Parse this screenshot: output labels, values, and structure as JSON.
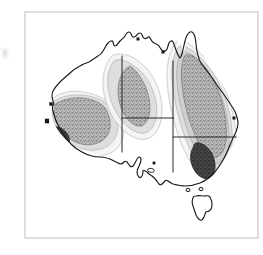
{
  "figure": {
    "width": 263,
    "height": 255,
    "background_color": "#ffffff",
    "frame": {
      "label": "map-frame",
      "x": 25,
      "y": 12,
      "width": 233,
      "height": 226,
      "stroke_color": "#c9c9c9",
      "stroke_width": 1.2,
      "fill_color": "#ffffff"
    },
    "artifacts": [
      {
        "name": "scan-smudge",
        "description": "faint gray scanning smudge at left margin",
        "x": 1,
        "y": 47,
        "width": 8,
        "height": 12,
        "color": "#969696"
      }
    ]
  },
  "map": {
    "region_name": "Australia",
    "coastline": {
      "name": "australia-coastline",
      "stroke_color": "#1a1a1a",
      "stroke_width": 1.15,
      "fill_color": "#ffffff"
    },
    "islands": [
      {
        "name": "tasmania",
        "stroke_color": "#1a1a1a",
        "stroke_width": 1.1
      },
      {
        "name": "kangaroo-island",
        "stroke_color": "#1a1a1a",
        "stroke_width": 1.0
      },
      {
        "name": "bass-strait-islet-west",
        "stroke_color": "#1a1a1a",
        "stroke_width": 1.0
      },
      {
        "name": "bass-strait-islet-east",
        "stroke_color": "#1a1a1a",
        "stroke_width": 1.0
      }
    ],
    "state_borders": {
      "name": "state-boundary-lines",
      "stroke_color": "#2a2a2a",
      "stroke_width": 1.0,
      "segments": [
        "wa-nt-sa-vertical",
        "nt-sa-horizontal",
        "qld-nsw-corner",
        "nsw-vic-horizontal",
        "sa-vic-vertical"
      ]
    },
    "coastal_markers": [
      {
        "name": "marker-shark-bay",
        "x": 51,
        "y": 104
      },
      {
        "name": "marker-perth",
        "x": 47,
        "y": 121
      },
      {
        "name": "marker-darwin",
        "x": 138,
        "y": 39
      },
      {
        "name": "marker-gulf-carpentaria",
        "x": 163,
        "y": 52
      },
      {
        "name": "marker-eyre-peninsula",
        "x": 154,
        "y": 163
      },
      {
        "name": "marker-sydney",
        "x": 234,
        "y": 118
      }
    ]
  },
  "chart_data": {
    "type": "heatmap",
    "subtitle": "",
    "xlabel": "",
    "ylabel": "",
    "legend_position": "none",
    "grid": false,
    "levels": [
      {
        "name": "level-0-background",
        "label": "lowest",
        "fill_color": "#ffffff",
        "value": 0
      },
      {
        "name": "level-1-faint",
        "label": "low",
        "fill_color": "#f2f2f2",
        "value": 1
      },
      {
        "name": "level-2-light",
        "label": "moderate",
        "fill_color": "#dcdcdc",
        "value": 2
      },
      {
        "name": "level-3-stipple",
        "label": "high",
        "fill_color": "#a9a9a9",
        "value": 3
      },
      {
        "name": "level-4-core",
        "label": "highest",
        "fill_color": "#3a3a3a",
        "value": 4
      }
    ],
    "contour_regions": [
      {
        "name": "southwest-western-australia",
        "level": 3,
        "centroid_x": 70,
        "centroid_y": 118,
        "has_dark_core": true,
        "core_level": 4,
        "core_centroid_x": 57,
        "core_centroid_y": 143
      },
      {
        "name": "central-northern-territory",
        "level": 3,
        "centroid_x": 122,
        "centroid_y": 100,
        "has_dark_core": false,
        "core_level": 0,
        "core_centroid_x": 0,
        "core_centroid_y": 0
      },
      {
        "name": "eastern-queensland-new-south-wales",
        "level": 3,
        "centroid_x": 195,
        "centroid_y": 110,
        "has_dark_core": true,
        "core_level": 4,
        "core_centroid_x": 201,
        "core_centroid_y": 165
      }
    ],
    "isolines": [
      {
        "name": "isoline-outer-west",
        "level": 1
      },
      {
        "name": "isoline-mid-west",
        "level": 2
      },
      {
        "name": "isoline-outer-central",
        "level": 1
      },
      {
        "name": "isoline-mid-central",
        "level": 2
      },
      {
        "name": "isoline-outer-east",
        "level": 1
      },
      {
        "name": "isoline-mid-east",
        "level": 2
      },
      {
        "name": "isoline-inner-east",
        "level": 2
      }
    ]
  }
}
